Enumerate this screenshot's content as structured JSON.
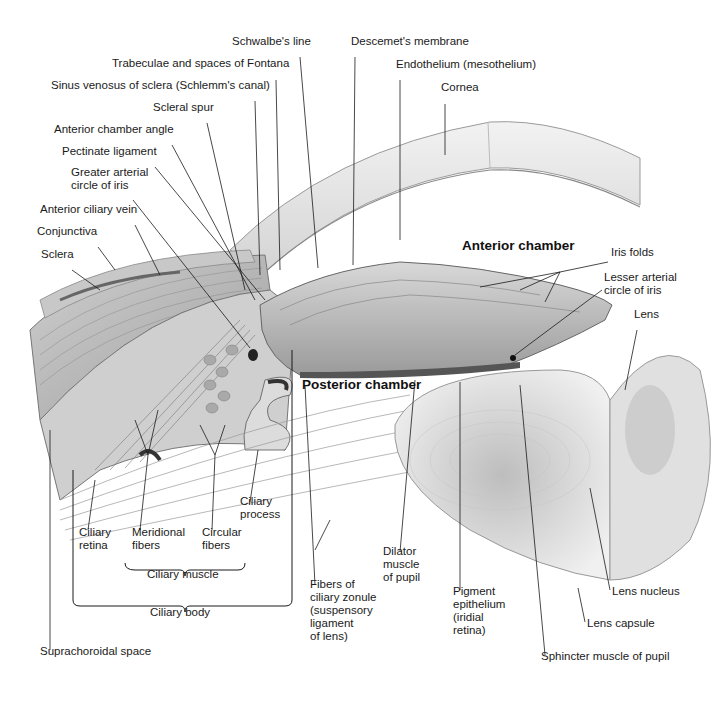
{
  "diagram": {
    "region_labels": [
      {
        "id": "anterior-chamber",
        "text": "Anterior chamber",
        "x": 462,
        "y": 249,
        "bold": true
      },
      {
        "id": "posterior-chamber",
        "text": "Posterior chamber",
        "x": 302,
        "y": 388,
        "bold": true
      }
    ],
    "labels": [
      {
        "id": "schwalbes-line",
        "text": "Schwalbe's line",
        "x": 232,
        "y": 45
      },
      {
        "id": "descemets-membrane",
        "text": "Descemet's membrane",
        "x": 351,
        "y": 45
      },
      {
        "id": "trabeculae-fontana",
        "text": "Trabeculae and spaces of Fontana",
        "x": 112,
        "y": 67
      },
      {
        "id": "endothelium",
        "text": "Endothelium (mesothelium)",
        "x": 396,
        "y": 68
      },
      {
        "id": "sinus-venosus",
        "text": "Sinus venosus of sclera (Schlemm's canal)",
        "x": 51,
        "y": 89
      },
      {
        "id": "cornea",
        "text": "Cornea",
        "x": 441,
        "y": 91
      },
      {
        "id": "scleral-spur",
        "text": "Scleral spur",
        "x": 153,
        "y": 111
      },
      {
        "id": "anterior-chamber-angle",
        "text": "Anterior chamber angle",
        "x": 54,
        "y": 133
      },
      {
        "id": "pectinate-ligament",
        "text": "Pectinate ligament",
        "x": 62,
        "y": 155
      },
      {
        "id": "greater-arterial-circle",
        "text": "Greater arterial\ncircle of iris",
        "x": 71,
        "y": 176
      },
      {
        "id": "anterior-ciliary-vein",
        "text": "Anterior ciliary vein",
        "x": 40,
        "y": 213
      },
      {
        "id": "conjunctiva",
        "text": "Conjunctiva",
        "x": 37,
        "y": 235
      },
      {
        "id": "sclera",
        "text": "Sclera",
        "x": 41,
        "y": 258
      },
      {
        "id": "iris-folds",
        "text": "Iris folds",
        "x": 611,
        "y": 256
      },
      {
        "id": "lesser-arterial-circle",
        "text": "Lesser arterial\ncircle of iris",
        "x": 604,
        "y": 281
      },
      {
        "id": "lens",
        "text": "Lens",
        "x": 634,
        "y": 318
      },
      {
        "id": "ciliary-process",
        "text": "Ciliary\nprocess",
        "x": 240,
        "y": 505
      },
      {
        "id": "ciliary-retina",
        "text": "Ciliary\nretina",
        "x": 79,
        "y": 536
      },
      {
        "id": "meridional-fibers",
        "text": "Meridional\nfibers",
        "x": 132,
        "y": 536
      },
      {
        "id": "circular-fibers",
        "text": "Circular\nfibers",
        "x": 202,
        "y": 536
      },
      {
        "id": "ciliary-muscle",
        "text": "Ciliary muscle",
        "x": 147,
        "y": 578
      },
      {
        "id": "dilator-muscle",
        "text": "Dilator\nmuscle\nof pupil",
        "x": 383,
        "y": 555
      },
      {
        "id": "fibers-ciliary-zonule",
        "text": "Fibers of\nciliary zonule\n(suspensory\nligament\nof lens)",
        "x": 310,
        "y": 588
      },
      {
        "id": "pigment-epithelium",
        "text": "Pigment\nepithelium\n(iridial\nretina)",
        "x": 453,
        "y": 595
      },
      {
        "id": "lens-nucleus",
        "text": "Lens nucleus",
        "x": 612,
        "y": 595
      },
      {
        "id": "lens-capsule",
        "text": "Lens capsule",
        "x": 587,
        "y": 627
      },
      {
        "id": "ciliary-body",
        "text": "Ciliary body",
        "x": 150,
        "y": 616
      },
      {
        "id": "suprachoroidal-space",
        "text": "Suprachoroidal space",
        "x": 40,
        "y": 655
      },
      {
        "id": "sphincter-muscle",
        "text": "Sphincter muscle of pupil",
        "x": 541,
        "y": 660
      }
    ],
    "brackets": [
      {
        "id": "ciliary-muscle-bracket",
        "groups": [
          "Meridional fibers",
          "Circular fibers"
        ],
        "label": "Ciliary muscle"
      },
      {
        "id": "ciliary-body-bracket",
        "groups": [
          "Ciliary retina",
          "Ciliary muscle",
          "Ciliary process"
        ],
        "label": "Ciliary body"
      }
    ],
    "colors": {
      "background": "#ffffff",
      "text": "#1a1a1a",
      "leader": "#1a1a1a",
      "tissue_light": "#e6e6e6",
      "tissue_mid": "#bdbdbd",
      "tissue_dark": "#7a7a7a"
    }
  }
}
